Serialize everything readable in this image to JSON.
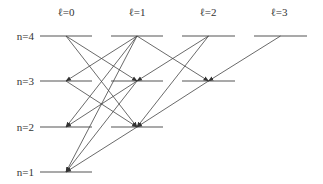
{
  "columns": [
    {
      "label": "ℓ=0",
      "l": 0,
      "x1": 40,
      "x2": 92
    },
    {
      "label": "ℓ=1",
      "l": 1,
      "x1": 111,
      "x2": 163
    },
    {
      "label": "ℓ=2",
      "l": 2,
      "x1": 182,
      "x2": 235
    },
    {
      "label": "ℓ=3",
      "l": 3,
      "x1": 254,
      "x2": 307
    }
  ],
  "rows": [
    {
      "label": "n=4",
      "n": 4,
      "y": 36
    },
    {
      "label": "n=3",
      "n": 3,
      "y": 81
    },
    {
      "label": "n=2",
      "n": 2,
      "y": 127
    },
    {
      "label": "n=1",
      "n": 1,
      "y": 172
    }
  ],
  "levels": [
    {
      "n": 4,
      "l": 0
    },
    {
      "n": 4,
      "l": 1
    },
    {
      "n": 4,
      "l": 2
    },
    {
      "n": 4,
      "l": 3
    },
    {
      "n": 3,
      "l": 0
    },
    {
      "n": 3,
      "l": 1
    },
    {
      "n": 3,
      "l": 2
    },
    {
      "n": 2,
      "l": 0
    },
    {
      "n": 2,
      "l": 1
    },
    {
      "n": 1,
      "l": 0
    }
  ],
  "transitions": [
    {
      "from": [
        4,
        0
      ],
      "to": [
        3,
        1
      ]
    },
    {
      "from": [
        4,
        0
      ],
      "to": [
        2,
        1
      ]
    },
    {
      "from": [
        4,
        1
      ],
      "to": [
        3,
        0
      ]
    },
    {
      "from": [
        4,
        1
      ],
      "to": [
        2,
        0
      ]
    },
    {
      "from": [
        4,
        1
      ],
      "to": [
        1,
        0
      ]
    },
    {
      "from": [
        4,
        1
      ],
      "to": [
        3,
        2
      ]
    },
    {
      "from": [
        4,
        2
      ],
      "to": [
        3,
        1
      ]
    },
    {
      "from": [
        4,
        2
      ],
      "to": [
        2,
        1
      ]
    },
    {
      "from": [
        4,
        3
      ],
      "to": [
        3,
        2
      ]
    },
    {
      "from": [
        3,
        0
      ],
      "to": [
        2,
        1
      ]
    },
    {
      "from": [
        3,
        1
      ],
      "to": [
        2,
        0
      ]
    },
    {
      "from": [
        3,
        1
      ],
      "to": [
        1,
        0
      ]
    },
    {
      "from": [
        3,
        2
      ],
      "to": [
        2,
        1
      ]
    },
    {
      "from": [
        2,
        1
      ],
      "to": [
        1,
        0
      ]
    }
  ],
  "colors": {
    "line": "#555555",
    "arrow": "#444444",
    "text": "#333333"
  }
}
